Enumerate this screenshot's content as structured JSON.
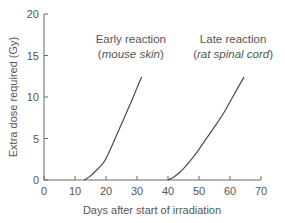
{
  "chart_data": {
    "type": "line",
    "title": "",
    "xlabel": "Days after start of irradiation",
    "ylabel": "Extra dose required (Gy)",
    "xlim": [
      0,
      70
    ],
    "ylim": [
      0,
      20
    ],
    "xticks": [
      0,
      10,
      20,
      30,
      40,
      50,
      60,
      70
    ],
    "yticks": [
      0,
      5,
      10,
      15,
      20
    ],
    "grid": false,
    "legend": null,
    "series": [
      {
        "name": "Early reaction (mouse skin)",
        "x": [
          13,
          15,
          17,
          19,
          20,
          22,
          24,
          26,
          28,
          30,
          31.5
        ],
        "y": [
          0,
          0.5,
          1.2,
          2.0,
          2.6,
          4.2,
          5.9,
          7.6,
          9.3,
          11.1,
          12.4
        ]
      },
      {
        "name": "Late reaction (rat spinal cord)",
        "x": [
          40,
          42,
          44,
          46,
          48,
          50,
          52,
          55,
          58,
          61,
          64.5
        ],
        "y": [
          0,
          0.4,
          1.0,
          1.8,
          2.7,
          3.7,
          4.8,
          6.4,
          8.1,
          10.1,
          12.4
        ]
      }
    ],
    "annotations": [
      {
        "line1": "Early reaction",
        "line2_open": "(",
        "line2_italic": "mouse skin",
        "line2_close": ")",
        "x_day": 28,
        "y_gy": 16.5
      },
      {
        "line1": "Late reaction",
        "line2_open": "(",
        "line2_italic": "rat spinal cord",
        "line2_close": ")",
        "x_day": 61,
        "y_gy": 16.5
      }
    ]
  },
  "axes": {
    "x_title": "Days after start of irradiation",
    "y_title": "Extra dose required (Gy)"
  },
  "colors": {
    "axis": "#666666",
    "line": "#4a4a4a",
    "text": "#555555"
  }
}
